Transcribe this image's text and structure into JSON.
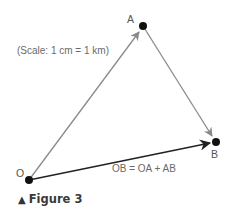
{
  "figure": {
    "caption_marker": "▲",
    "caption": "Figure 3",
    "scale_note": "(Scale: 1 cm = 1 km)",
    "equation": "OB = OA + AB"
  },
  "points": {
    "O": {
      "label": "O",
      "x": 29,
      "y": 180
    },
    "A": {
      "label": "A",
      "x": 143,
      "y": 26
    },
    "B": {
      "label": "B",
      "x": 216,
      "y": 142
    }
  },
  "vectors": [
    {
      "name": "OA",
      "from": "O",
      "to": "A",
      "color": "#8a8a8a"
    },
    {
      "name": "AB",
      "from": "A",
      "to": "B",
      "color": "#8a8a8a"
    },
    {
      "name": "OB",
      "from": "O",
      "to": "B",
      "color": "#222222",
      "resultant": true
    }
  ],
  "colors": {
    "component_vector": "#8a8a8a",
    "resultant_vector": "#222222",
    "point": "#111111",
    "text": "#6a6a6a"
  }
}
